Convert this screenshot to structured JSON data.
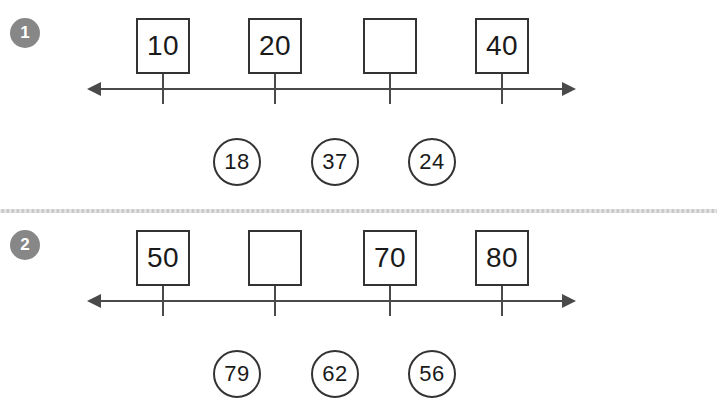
{
  "worksheet": {
    "divider_color": "#c9c9c9",
    "line_color": "#4a4a4a",
    "box_border_color": "#333333",
    "badge_color": "#878787"
  },
  "problems": [
    {
      "number": "1",
      "boxes": [
        {
          "value": "10",
          "empty": false
        },
        {
          "value": "20",
          "empty": false
        },
        {
          "value": "",
          "empty": true
        },
        {
          "value": "40",
          "empty": false
        }
      ],
      "choices": [
        "18",
        "37",
        "24"
      ]
    },
    {
      "number": "2",
      "boxes": [
        {
          "value": "50",
          "empty": false
        },
        {
          "value": "",
          "empty": true
        },
        {
          "value": "70",
          "empty": false
        },
        {
          "value": "80",
          "empty": false
        }
      ],
      "choices": [
        "79",
        "62",
        "56"
      ]
    }
  ]
}
